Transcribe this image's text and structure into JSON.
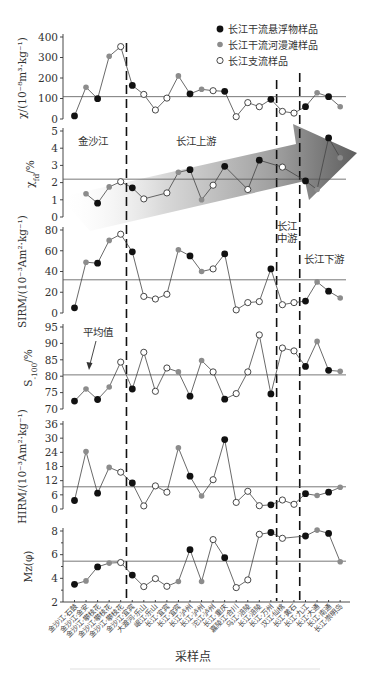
{
  "legend": {
    "items": [
      {
        "label": "长江干流悬浮物样品",
        "marker": "suspended"
      },
      {
        "label": "长江干流河漫滩样品",
        "marker": "floodplain"
      },
      {
        "label": "长江支流样品",
        "marker": "tributary"
      }
    ]
  },
  "sections": [
    "金沙江",
    "长江上游",
    "长江",
    "中游",
    "长江下游"
  ],
  "annotation": {
    "mean_label": "平均值"
  },
  "colors": {
    "suspended": "#111111",
    "floodplain": "#8c8c8c",
    "tributary": "#ffffff",
    "arrow_dark": "#5e5e5e"
  },
  "chart_data": {
    "type": "line",
    "title": "",
    "xlabel": "采样点",
    "legend_position": "top-right",
    "grid": false,
    "categories": [
      "金沙江·石鼓",
      "金沙江·金安",
      "金沙江·攀枝花",
      "金沙江·攀枝花",
      "金沙江·攀枝花",
      "金沙江·宜宾",
      "大渡河·乐山",
      "岷江·乐山",
      "长江·宜宾",
      "长江·宜宾",
      "长江·泸州",
      "长江·泸州",
      "沱江·泸州",
      "长江·重庆",
      "嘉陵江·合川",
      "乌江·涪陵",
      "长江·涪陵",
      "长江·万州",
      "汉江·仙桃",
      "长江·黄石",
      "长江·九江",
      "长江·大通",
      "长江·南通",
      "长江·崇明岛"
    ],
    "marker_types": [
      "suspended",
      "floodplain",
      "suspended",
      "floodplain",
      "tributary",
      "suspended",
      "tributary",
      "tributary",
      "tributary",
      "floodplain",
      "suspended",
      "floodplain",
      "tributary",
      "suspended",
      "tributary",
      "tributary",
      "tributary",
      "suspended",
      "tributary",
      "tributary",
      "suspended",
      "floodplain",
      "suspended",
      "floodplain"
    ],
    "section_boundaries_after": [
      5,
      18,
      20
    ],
    "section_labels": [
      "金沙江",
      "长江上游",
      "长江中游",
      "长江下游"
    ],
    "panels": [
      {
        "id": "chi",
        "ylabel_parts": [
          {
            "text": "χ/(10⁻⁸m³·kg⁻¹)"
          }
        ],
        "ylim": [
          0,
          400
        ],
        "ticks": [
          0,
          100,
          200,
          300,
          400
        ],
        "mean": 109,
        "values": [
          15,
          155,
          99,
          306,
          353,
          164,
          120,
          44,
          102,
          210,
          123,
          145,
          138,
          135,
          11,
          80,
          60,
          96,
          37,
          29,
          60,
          128,
          109,
          60
        ]
      },
      {
        "id": "chi-fd",
        "ylabel_parts": [
          {
            "text": "χ"
          },
          {
            "text": "fd",
            "sub": true
          },
          {
            "text": "/%"
          }
        ],
        "ylim": [
          0,
          5
        ],
        "ticks": [
          0,
          1,
          2,
          3,
          4,
          5
        ],
        "mean": 2.2,
        "values": [
          null,
          1.35,
          0.8,
          1.75,
          2.05,
          1.7,
          1.05,
          null,
          1.4,
          2.6,
          2.75,
          1.0,
          1.85,
          2.95,
          null,
          1.6,
          3.3,
          null,
          2.9,
          null,
          2.1,
          1.6,
          4.6,
          3.45
        ],
        "marker_overrides": {
          "16": "suspended"
        },
        "trend_arrow": true
      },
      {
        "id": "sirm",
        "ylabel_parts": [
          {
            "text": "SIRM/(10⁻³Am²·kg⁻¹)"
          }
        ],
        "ylim": [
          0,
          80
        ],
        "ticks": [
          0,
          20,
          40,
          60,
          80
        ],
        "mean": 32,
        "values": [
          5,
          49,
          48,
          70,
          76,
          59,
          16,
          13.5,
          18,
          61,
          55,
          40,
          42.5,
          57,
          3,
          10,
          11,
          42.5,
          8,
          10,
          11.5,
          30,
          21,
          14.5
        ]
      },
      {
        "id": "s-100",
        "ylabel_parts": [
          {
            "text": "S"
          },
          {
            "text": "-100",
            "sub": true
          },
          {
            "text": "/%"
          }
        ],
        "ylim": [
          70,
          95
        ],
        "ticks": [
          70,
          75,
          80,
          85,
          90,
          95
        ],
        "mean": 80.4,
        "values": [
          72.4,
          76.1,
          72.9,
          76.7,
          84.3,
          76.1,
          87.3,
          75.4,
          82.5,
          81.3,
          73.9,
          84.8,
          81.3,
          73.0,
          74.7,
          81.3,
          92.6,
          74.6,
          88.6,
          87.7,
          83.0,
          90.6,
          81.8,
          81.5
        ]
      },
      {
        "id": "hirm",
        "ylabel_parts": [
          {
            "text": "HIRM/(10⁻³Am²·kg⁻¹)"
          }
        ],
        "ylim": [
          0,
          36
        ],
        "ticks": [
          0,
          6,
          12,
          18,
          24,
          30,
          36
        ],
        "mean": 9.4,
        "values": [
          3.6,
          24.3,
          6.7,
          17.6,
          15.6,
          11.0,
          1.3,
          9.8,
          7.1,
          25.9,
          13.9,
          5.5,
          12.4,
          29.4,
          2.8,
          7.5,
          1.4,
          1.8,
          3.8,
          2.0,
          6.5,
          5.7,
          7.1,
          9.2
        ]
      },
      {
        "id": "mz",
        "ylabel_parts": [
          {
            "text": "Mz(φ)"
          }
        ],
        "ylim": [
          2,
          9
        ],
        "ticks": [
          2,
          4,
          6,
          8
        ],
        "minor_ticks": [
          3,
          5,
          7
        ],
        "mean": 5.45,
        "values": [
          3.5,
          3.78,
          4.97,
          5.29,
          5.34,
          4.27,
          3.3,
          3.98,
          3.33,
          3.73,
          6.42,
          3.73,
          7.27,
          5.74,
          3.22,
          3.87,
          7.72,
          7.87,
          7.38,
          null,
          7.58,
          8.08,
          7.8,
          5.4
        ]
      }
    ]
  }
}
